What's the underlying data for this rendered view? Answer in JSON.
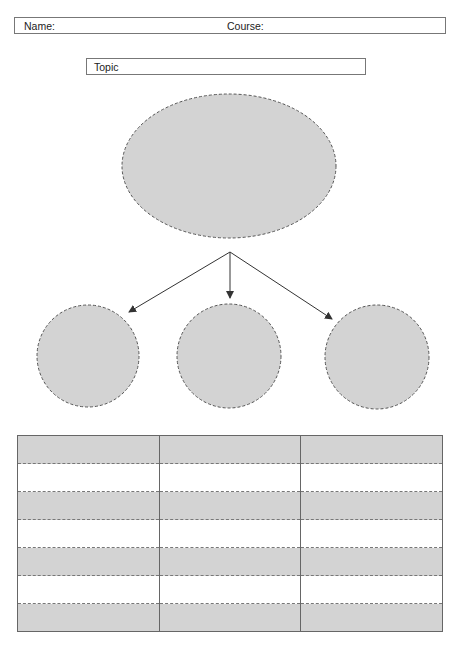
{
  "header": {
    "name_label": "Name:",
    "course_label": "Course:"
  },
  "topic": {
    "label": "Topic"
  },
  "diagram": {
    "fill_color": "#d3d3d3",
    "stroke_color": "#555555",
    "main_node": "ellipse",
    "child_nodes": 3
  },
  "table": {
    "columns": 3,
    "rows": [
      {
        "shaded": true,
        "cells": [
          "",
          "",
          ""
        ]
      },
      {
        "shaded": false,
        "cells": [
          "",
          "",
          ""
        ]
      },
      {
        "shaded": true,
        "cells": [
          "",
          "",
          ""
        ]
      },
      {
        "shaded": false,
        "cells": [
          "",
          "",
          ""
        ]
      },
      {
        "shaded": true,
        "cells": [
          "",
          "",
          ""
        ]
      },
      {
        "shaded": false,
        "cells": [
          "",
          "",
          ""
        ]
      },
      {
        "shaded": true,
        "cells": [
          "",
          "",
          ""
        ]
      }
    ]
  }
}
